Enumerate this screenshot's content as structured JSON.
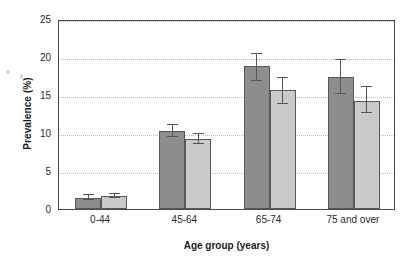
{
  "chart_data": {
    "type": "bar",
    "title": "",
    "subtitle": "",
    "xlabel": "Age group (years)",
    "ylabel": "Prevalence (%)",
    "categories": [
      "0-44",
      "45-64",
      "65-74",
      "75 and over"
    ],
    "ylim": [
      0,
      25
    ],
    "yticks": [
      0,
      5,
      10,
      15,
      20,
      25
    ],
    "ytick_labels": [
      "0",
      "5",
      "10",
      "15",
      "20",
      "25"
    ],
    "grid": "horizontal-dotted",
    "legend": "none",
    "series": [
      {
        "name": "series-1",
        "color": "#8d8d8d",
        "values": [
          1.5,
          10.2,
          18.8,
          17.4
        ],
        "error_low": [
          1.2,
          9.5,
          16.8,
          15.1
        ],
        "error_high": [
          1.8,
          11.0,
          20.4,
          19.6
        ]
      },
      {
        "name": "series-2",
        "color": "#cacaca",
        "values": [
          1.7,
          9.2,
          15.6,
          14.2
        ],
        "error_low": [
          1.4,
          8.5,
          13.8,
          12.6
        ],
        "error_high": [
          2.0,
          9.9,
          17.3,
          16.0
        ]
      }
    ]
  },
  "style": {
    "bar_edge_color": "#585858",
    "axis_color": "#4a4a4a",
    "grid_color": "#b9b9b9",
    "text_color": "#2a2a2a",
    "background": "#ffffff"
  }
}
